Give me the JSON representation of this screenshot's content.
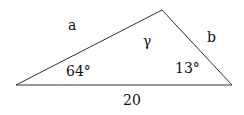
{
  "diagram": {
    "type": "triangle",
    "side_labels": {
      "left": "a",
      "right": "b",
      "base": "20"
    },
    "angle_labels": {
      "left": "64°",
      "right": "13°",
      "apex": "γ"
    },
    "colors": {
      "stroke": "#333333",
      "text": "#111111",
      "background": "#ffffff"
    }
  }
}
